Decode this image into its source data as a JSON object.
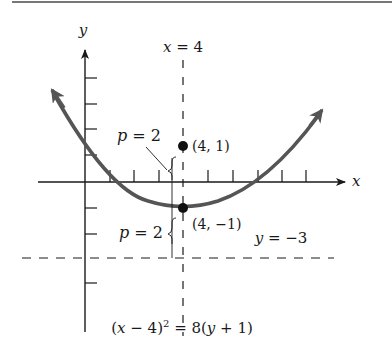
{
  "figure": {
    "axes": {
      "x_label": "x",
      "y_label": "y"
    },
    "directrix_label": "y = −3",
    "axis_of_symmetry_label": "x = 4",
    "focus": {
      "label": "(4, 1)",
      "x": 4,
      "y": 1
    },
    "vertex": {
      "label": "(4, −1)",
      "x": 4,
      "y": -1
    },
    "p_upper_label": "p = 2",
    "p_lower_label": "p = 2",
    "equation": "(x − 4)² = 8(y + 1)",
    "colors": {
      "curve": "#555555",
      "axes": "#1a1a1a",
      "rule": "#777777"
    }
  }
}
